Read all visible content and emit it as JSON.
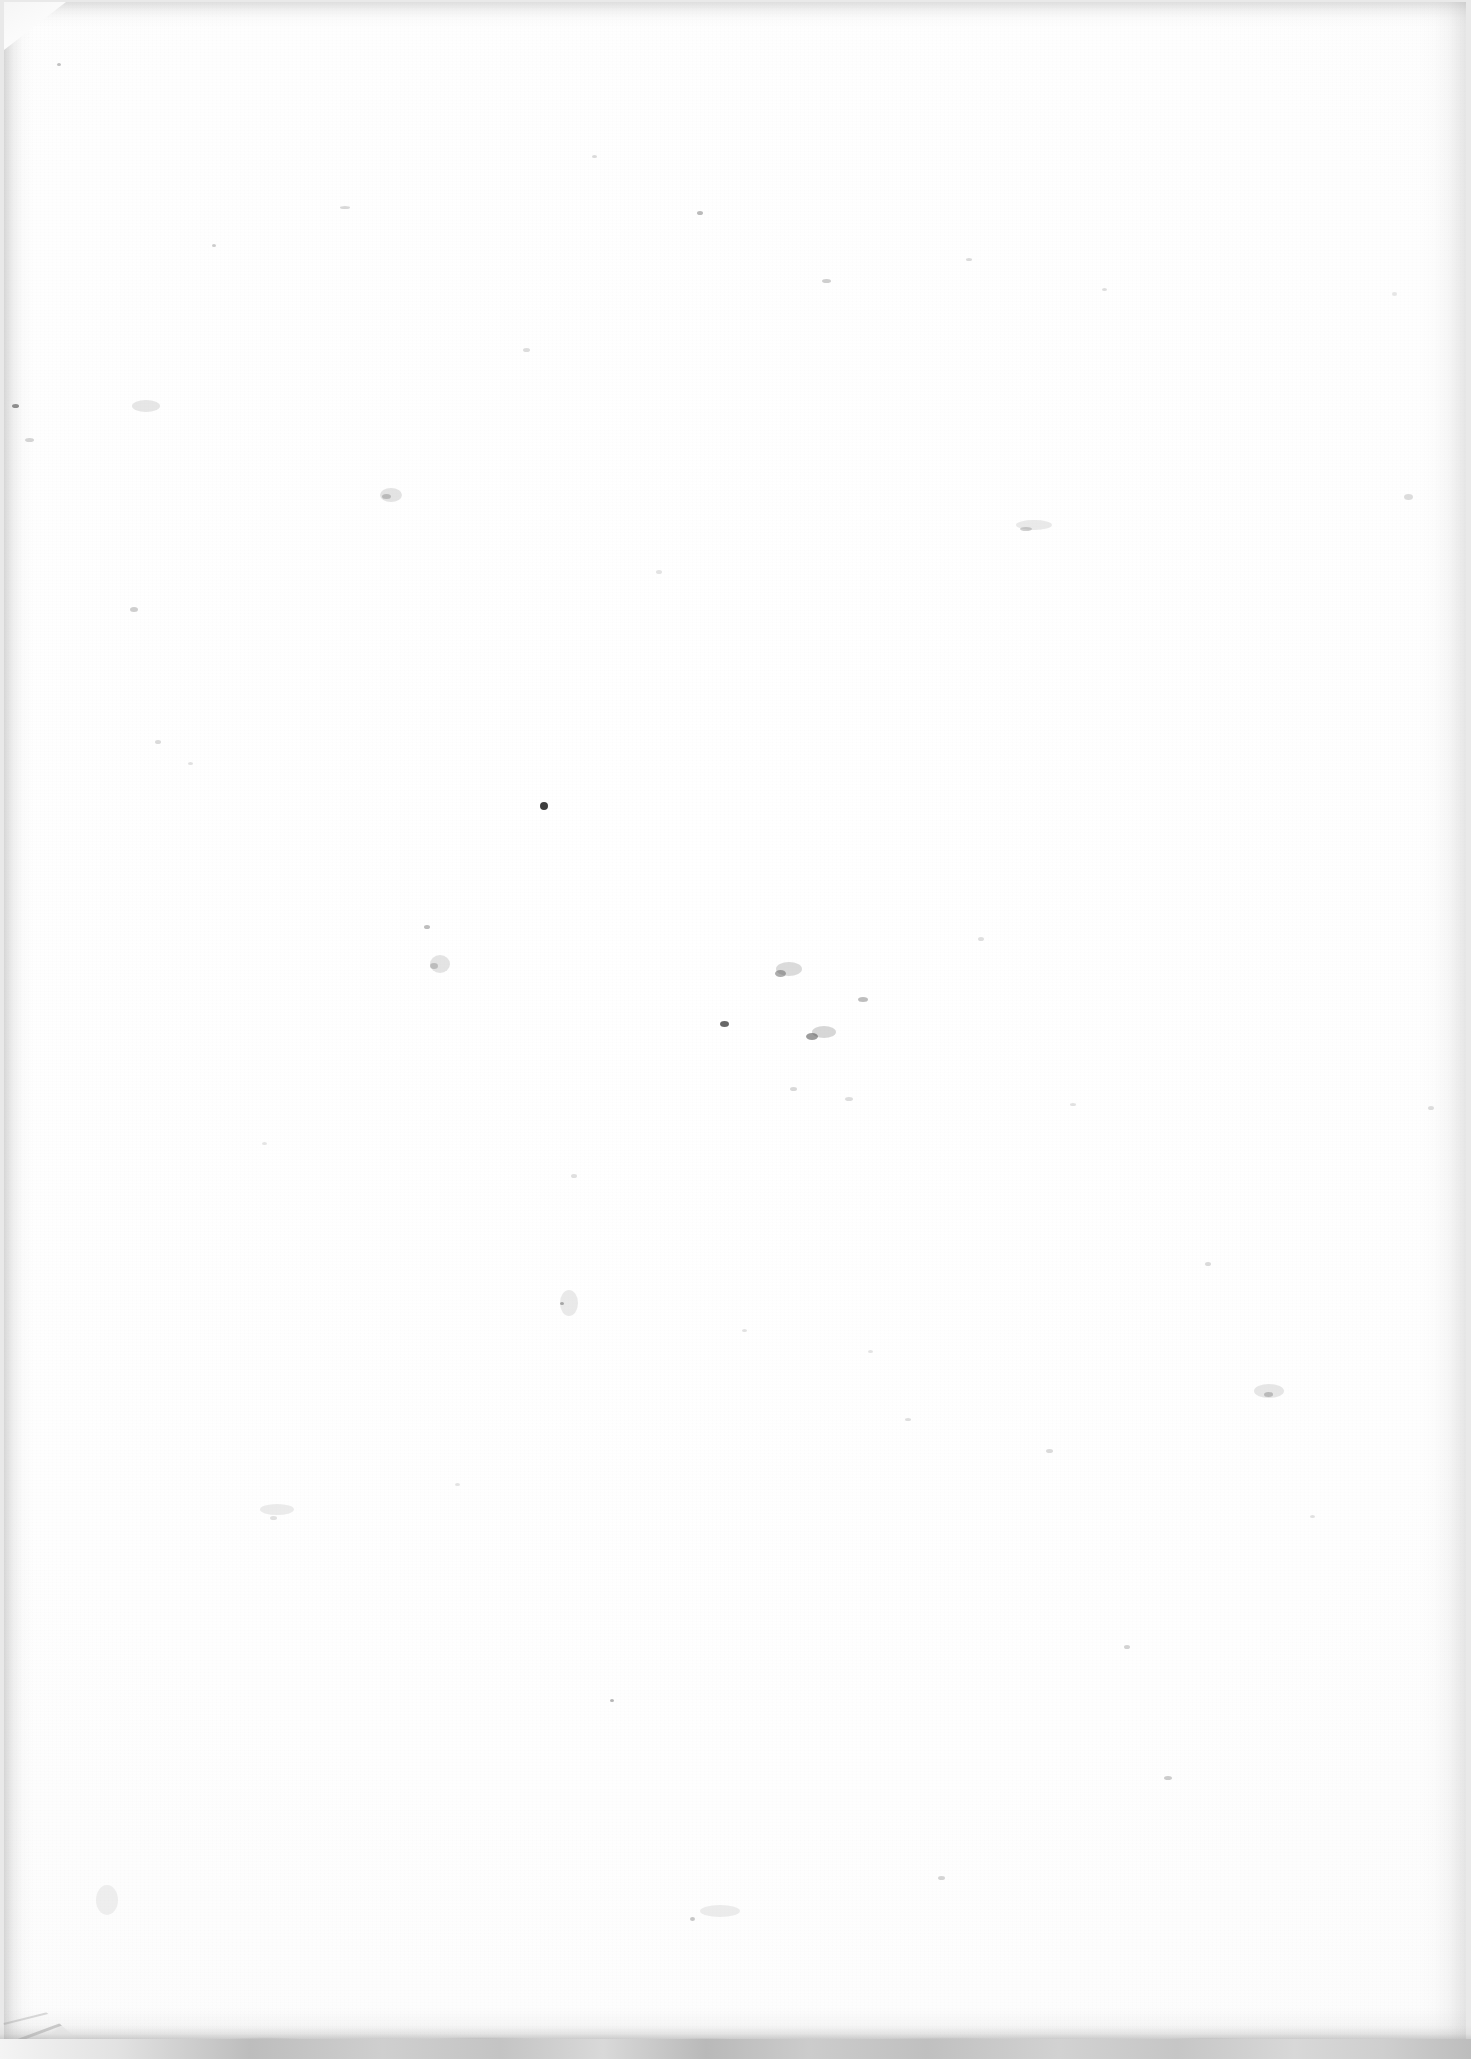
{
  "document": {
    "kind": "scanned-page",
    "content_text": "",
    "is_blank": true,
    "page_width_px": 1471,
    "page_height_px": 2059
  },
  "colors": {
    "paper": "#fdfdfd",
    "paper_center": "#ffffff",
    "scanner_bed": "#e9e9e9",
    "edge_shadow": "#969696",
    "bottom_band": "#c4c4c4",
    "speck": "#9a9a9a",
    "dark_speck": "#3a3a3a"
  },
  "sheet": {
    "left": 4,
    "top": 2,
    "width": 1462,
    "height": 2040
  },
  "artifacts": {
    "corner_fold_top_left": {
      "width": 62,
      "height": 48
    },
    "corner_cut_bottom_left": {
      "width": 240,
      "height": 120
    },
    "bottom_scanner_band_height": 20
  },
  "specks": [
    {
      "x": 57,
      "y": 63,
      "w": 4,
      "h": 3,
      "c": "rgba(120,120,120,0.45)"
    },
    {
      "x": 12,
      "y": 404,
      "w": 7,
      "h": 4,
      "c": "rgba(70,70,70,0.65)"
    },
    {
      "x": 25,
      "y": 438,
      "w": 9,
      "h": 4,
      "c": "rgba(150,150,150,0.40)"
    },
    {
      "x": 130,
      "y": 607,
      "w": 8,
      "h": 5,
      "c": "rgba(140,140,140,0.42)"
    },
    {
      "x": 155,
      "y": 740,
      "w": 6,
      "h": 4,
      "c": "rgba(155,155,155,0.36)"
    },
    {
      "x": 188,
      "y": 762,
      "w": 5,
      "h": 3,
      "c": "rgba(165,165,165,0.32)"
    },
    {
      "x": 212,
      "y": 244,
      "w": 4,
      "h": 3,
      "c": "rgba(130,130,130,0.40)"
    },
    {
      "x": 262,
      "y": 1142,
      "w": 5,
      "h": 3,
      "c": "rgba(170,170,170,0.30)"
    },
    {
      "x": 270,
      "y": 1516,
      "w": 7,
      "h": 4,
      "c": "rgba(160,160,160,0.30)"
    },
    {
      "x": 340,
      "y": 206,
      "w": 10,
      "h": 3,
      "c": "rgba(150,150,150,0.36)"
    },
    {
      "x": 382,
      "y": 494,
      "w": 9,
      "h": 5,
      "c": "rgba(135,135,135,0.45)"
    },
    {
      "x": 424,
      "y": 925,
      "w": 6,
      "h": 4,
      "c": "rgba(120,120,120,0.48)"
    },
    {
      "x": 430,
      "y": 963,
      "w": 8,
      "h": 6,
      "c": "rgba(140,140,140,0.44)"
    },
    {
      "x": 455,
      "y": 1483,
      "w": 5,
      "h": 3,
      "c": "rgba(165,165,165,0.30)"
    },
    {
      "x": 523,
      "y": 348,
      "w": 7,
      "h": 4,
      "c": "rgba(155,155,155,0.34)"
    },
    {
      "x": 540,
      "y": 802,
      "w": 8,
      "h": 8,
      "c": "rgba(35,35,35,0.88)"
    },
    {
      "x": 560,
      "y": 1302,
      "w": 4,
      "h": 3,
      "c": "rgba(110,110,110,0.55)"
    },
    {
      "x": 571,
      "y": 1174,
      "w": 6,
      "h": 4,
      "c": "rgba(160,160,160,0.32)"
    },
    {
      "x": 592,
      "y": 155,
      "w": 5,
      "h": 3,
      "c": "rgba(150,150,150,0.34)"
    },
    {
      "x": 610,
      "y": 1699,
      "w": 4,
      "h": 3,
      "c": "rgba(115,115,115,0.52)"
    },
    {
      "x": 656,
      "y": 570,
      "w": 6,
      "h": 4,
      "c": "rgba(165,165,165,0.30)"
    },
    {
      "x": 690,
      "y": 1917,
      "w": 5,
      "h": 4,
      "c": "rgba(130,130,130,0.44)"
    },
    {
      "x": 697,
      "y": 211,
      "w": 6,
      "h": 4,
      "c": "rgba(120,120,120,0.50)"
    },
    {
      "x": 720,
      "y": 1021,
      "w": 9,
      "h": 6,
      "c": "rgba(45,45,45,0.72)"
    },
    {
      "x": 742,
      "y": 1329,
      "w": 5,
      "h": 3,
      "c": "rgba(160,160,160,0.30)"
    },
    {
      "x": 775,
      "y": 970,
      "w": 11,
      "h": 7,
      "c": "rgba(105,105,105,0.55)"
    },
    {
      "x": 790,
      "y": 1087,
      "w": 7,
      "h": 4,
      "c": "rgba(150,150,150,0.36)"
    },
    {
      "x": 806,
      "y": 1033,
      "w": 12,
      "h": 7,
      "c": "rgba(90,90,90,0.60)"
    },
    {
      "x": 822,
      "y": 279,
      "w": 9,
      "h": 4,
      "c": "rgba(140,140,140,0.42)"
    },
    {
      "x": 845,
      "y": 1097,
      "w": 8,
      "h": 4,
      "c": "rgba(155,155,155,0.34)"
    },
    {
      "x": 858,
      "y": 997,
      "w": 10,
      "h": 5,
      "c": "rgba(120,120,120,0.48)"
    },
    {
      "x": 868,
      "y": 1350,
      "w": 5,
      "h": 3,
      "c": "rgba(165,165,165,0.30)"
    },
    {
      "x": 905,
      "y": 1418,
      "w": 6,
      "h": 3,
      "c": "rgba(155,155,155,0.32)"
    },
    {
      "x": 938,
      "y": 1876,
      "w": 7,
      "h": 4,
      "c": "rgba(145,145,145,0.38)"
    },
    {
      "x": 966,
      "y": 258,
      "w": 6,
      "h": 3,
      "c": "rgba(150,150,150,0.34)"
    },
    {
      "x": 978,
      "y": 937,
      "w": 6,
      "h": 4,
      "c": "rgba(160,160,160,0.32)"
    },
    {
      "x": 1020,
      "y": 527,
      "w": 12,
      "h": 4,
      "c": "rgba(140,140,140,0.40)"
    },
    {
      "x": 1046,
      "y": 1449,
      "w": 7,
      "h": 4,
      "c": "rgba(150,150,150,0.34)"
    },
    {
      "x": 1070,
      "y": 1103,
      "w": 6,
      "h": 3,
      "c": "rgba(160,160,160,0.30)"
    },
    {
      "x": 1102,
      "y": 288,
      "w": 5,
      "h": 3,
      "c": "rgba(155,155,155,0.32)"
    },
    {
      "x": 1124,
      "y": 1645,
      "w": 6,
      "h": 4,
      "c": "rgba(140,140,140,0.38)"
    },
    {
      "x": 1164,
      "y": 1776,
      "w": 8,
      "h": 4,
      "c": "rgba(135,135,135,0.42)"
    },
    {
      "x": 1205,
      "y": 1262,
      "w": 6,
      "h": 4,
      "c": "rgba(150,150,150,0.34)"
    },
    {
      "x": 1264,
      "y": 1392,
      "w": 9,
      "h": 5,
      "c": "rgba(130,130,130,0.44)"
    },
    {
      "x": 1310,
      "y": 1515,
      "w": 5,
      "h": 3,
      "c": "rgba(160,160,160,0.30)"
    },
    {
      "x": 1404,
      "y": 494,
      "w": 9,
      "h": 6,
      "c": "rgba(160,160,160,0.36)"
    },
    {
      "x": 1392,
      "y": 292,
      "w": 5,
      "h": 4,
      "c": "rgba(170,170,170,0.28)"
    },
    {
      "x": 1428,
      "y": 1106,
      "w": 6,
      "h": 4,
      "c": "rgba(150,150,150,0.32)"
    }
  ],
  "smudges": [
    {
      "x": 132,
      "y": 400,
      "w": 28,
      "h": 12,
      "c": "rgba(175,175,175,0.30)"
    },
    {
      "x": 380,
      "y": 488,
      "w": 22,
      "h": 14,
      "c": "rgba(170,170,170,0.32)"
    },
    {
      "x": 260,
      "y": 1504,
      "w": 34,
      "h": 11,
      "c": "rgba(180,180,180,0.26)"
    },
    {
      "x": 430,
      "y": 955,
      "w": 20,
      "h": 18,
      "c": "rgba(165,165,165,0.30)"
    },
    {
      "x": 776,
      "y": 962,
      "w": 26,
      "h": 14,
      "c": "rgba(150,150,150,0.34)"
    },
    {
      "x": 812,
      "y": 1026,
      "w": 24,
      "h": 12,
      "c": "rgba(145,145,145,0.36)"
    },
    {
      "x": 1016,
      "y": 520,
      "w": 36,
      "h": 10,
      "c": "rgba(175,175,175,0.26)"
    },
    {
      "x": 1254,
      "y": 1384,
      "w": 30,
      "h": 14,
      "c": "rgba(170,170,170,0.28)"
    },
    {
      "x": 560,
      "y": 1290,
      "w": 18,
      "h": 26,
      "c": "rgba(175,175,175,0.26)"
    },
    {
      "x": 96,
      "y": 1885,
      "w": 22,
      "h": 30,
      "c": "rgba(185,185,185,0.22)"
    },
    {
      "x": 700,
      "y": 1905,
      "w": 40,
      "h": 12,
      "c": "rgba(180,180,180,0.24)"
    }
  ]
}
